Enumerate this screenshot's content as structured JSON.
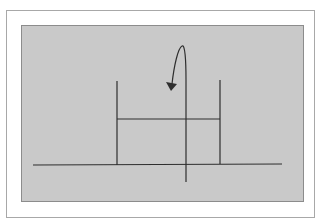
{
  "diagram": {
    "type": "schematic",
    "colors": {
      "page_background": "#ffffff",
      "frame_border": "#a8a8a8",
      "panel_fill": "#c9c9c9",
      "panel_border": "#8c8c8c",
      "line_color": "#2e2e2e"
    },
    "elements": {
      "baseline": {
        "x1": 33,
        "y1": 165,
        "x2": 282,
        "y2": 164
      },
      "left_post": {
        "x1": 117,
        "y1": 81,
        "x2": 117,
        "y2": 165
      },
      "right_post": {
        "x1": 220,
        "y1": 80,
        "x2": 220,
        "y2": 164
      },
      "crossbar": {
        "x1": 117,
        "y1": 119,
        "x2": 220,
        "y2": 119
      },
      "center_post": {
        "x1": 186,
        "y1": 80,
        "x2": 186,
        "y2": 182
      },
      "curved_arrow": {
        "path": "M186 80 C186 60 185 44 182 46 C178 48 174 66 172 84",
        "head": "166,82 177,84 171,91"
      }
    }
  }
}
